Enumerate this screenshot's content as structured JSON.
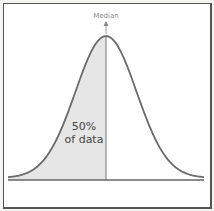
{
  "chart_data": {
    "type": "area",
    "title": "",
    "subtitle": "",
    "xlabel": "",
    "ylabel": "",
    "distribution": "normal",
    "mean": 0,
    "std": 1,
    "x_range": [
      -3.2,
      3.2
    ],
    "grid": false,
    "legend": null,
    "annotations": [
      {
        "text": "Median",
        "position": "top, at x = 0 (peak)",
        "arrow": true
      },
      {
        "text": "50%",
        "position": "inside shaded region"
      },
      {
        "text": "of data",
        "position": "inside shaded region"
      }
    ],
    "shaded_region": {
      "from": "-inf",
      "to": 0,
      "fraction": 0.5,
      "color": "#e6e6e6"
    },
    "median_x": 0
  },
  "labels": {
    "median": "Median",
    "percent": "50%",
    "percent_caption": "of data"
  },
  "colors": {
    "curve": "#6a6a6a",
    "shade": "#e6e6e6",
    "axis": "#666666",
    "frame": "#555555",
    "median_text": "#8a8a8a"
  }
}
